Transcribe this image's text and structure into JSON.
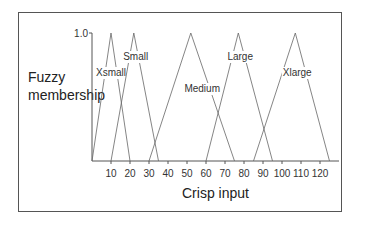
{
  "chart_data": {
    "type": "line",
    "title": "",
    "xlabel": "Crisp input",
    "ylabel": "Fuzzy membership",
    "y_tick_label": "1.0",
    "xlim": [
      0,
      130
    ],
    "ylim": [
      0,
      1.0
    ],
    "x_ticks": [
      10,
      20,
      30,
      40,
      50,
      60,
      70,
      80,
      90,
      100,
      110,
      120
    ],
    "grid": false,
    "legend": "inline labels",
    "series": [
      {
        "name": "Xsmall",
        "x": [
          0,
          10,
          20
        ],
        "y": [
          0,
          1,
          0
        ]
      },
      {
        "name": "Small",
        "x": [
          10,
          22,
          35
        ],
        "y": [
          0,
          1,
          0
        ]
      },
      {
        "name": "Medium",
        "x": [
          30,
          52,
          75
        ],
        "y": [
          0,
          1,
          0
        ]
      },
      {
        "name": "Large",
        "x": [
          60,
          77,
          95
        ],
        "y": [
          0,
          1,
          0
        ]
      },
      {
        "name": "Xlarge",
        "x": [
          85,
          107,
          125
        ],
        "y": [
          0,
          1,
          0
        ]
      }
    ]
  },
  "labels": {
    "ylabel_line1": "Fuzzy",
    "ylabel_line2": "membership",
    "xlabel": "Crisp input",
    "ytick": "1.0",
    "sets": [
      "Xsmall",
      "Small",
      "Medium",
      "Large",
      "Xlarge"
    ],
    "xticks": [
      "10",
      "20",
      "30",
      "40",
      "50",
      "60",
      "70",
      "80",
      "90",
      "100",
      "110",
      "120"
    ]
  }
}
